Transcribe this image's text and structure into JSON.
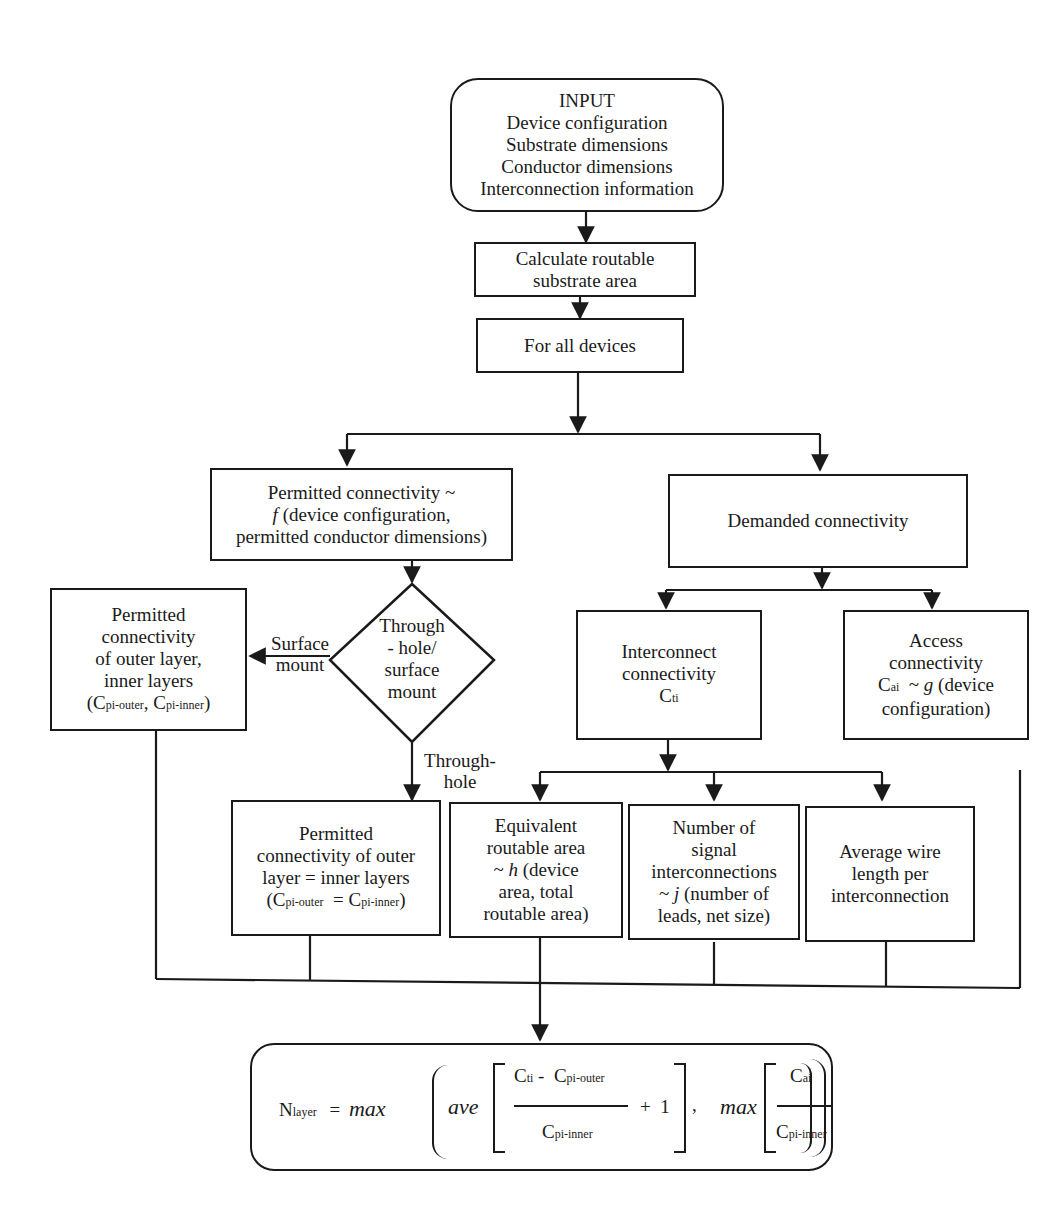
{
  "diagram": {
    "type": "flowchart",
    "input": {
      "title": "INPUT",
      "lines": [
        "Device configuration",
        "Substrate dimensions",
        "Conductor dimensions",
        "Interconnection information"
      ]
    },
    "calc_area": {
      "lines": [
        "Calculate routable",
        "substrate area"
      ]
    },
    "for_all": {
      "label": "For all devices"
    },
    "permitted": {
      "line1": "Permitted connectivity ~",
      "line2_fn": "f",
      "line2_rest": " (device configuration,",
      "line3": "permitted conductor dimensions)"
    },
    "demanded": {
      "label": "Demanded connectivity"
    },
    "decision": {
      "lines": [
        "Through",
        "- hole/",
        "surface",
        "mount"
      ]
    },
    "edge_labels": {
      "surface_mount": [
        "Surface",
        "mount"
      ],
      "through_hole": [
        "Through-",
        "hole"
      ]
    },
    "permitted_outer_inner": {
      "lines": [
        "Permitted",
        "connectivity",
        "of  outer layer,",
        "inner layers"
      ],
      "formula": {
        "open": "(C",
        "sub1": "pi-outer",
        "mid": ", C",
        "sub2": "pi-inner",
        "close": ")"
      }
    },
    "permitted_equal": {
      "lines": [
        "Permitted",
        "connectivity of outer",
        "layer = inner layers"
      ],
      "formula": {
        "open": "(C",
        "sub1": "pi-outer",
        "mid": "  = C",
        "sub2": "pi-inner",
        "close": ")"
      }
    },
    "interconnect": {
      "lines": [
        "Interconnect",
        "connectivity"
      ],
      "symbol": "C",
      "symbol_sub": "ti"
    },
    "access": {
      "lines": [
        "Access",
        "connectivity"
      ],
      "line3_sym": "C",
      "line3_sub": "ai",
      "line3_mid": "  ~ ",
      "line3_fn": "g",
      "line3_rest": " (device",
      "line4": "configuration)"
    },
    "equivalent": {
      "line1": "Equivalent",
      "line2": "routable area",
      "line3_pre": "~ ",
      "line3_fn": "h",
      "line3_rest": " (device",
      "line4": "area, total",
      "line5": "routable area)"
    },
    "num_signal": {
      "line1": "Number of",
      "line2": "signal",
      "line3": "interconnections",
      "line4_pre": "~ ",
      "line4_fn": "j",
      "line4_rest": " (number of",
      "line5": "leads, net size)"
    },
    "avg_wire": {
      "lines": [
        "Average wire",
        "length per",
        "interconnection"
      ]
    },
    "result_formula": {
      "lhs": "N",
      "lhs_sub": "layer",
      "eq": "=",
      "max1": "max",
      "ave": "ave",
      "num1": "C",
      "num1_sub": "ti",
      "num1_minus": " -  C",
      "num1_sub2": "pi-outer",
      "den1": "C",
      "den1_sub": "pi-inner",
      "plus_one": "+  1",
      "comma": ",",
      "max2": "max",
      "num2": "C",
      "num2_sub": "ai",
      "den2": "C",
      "den2_sub": "pi-inner"
    }
  }
}
